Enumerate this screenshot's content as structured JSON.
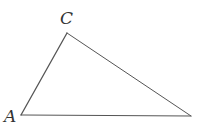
{
  "figure": {
    "type": "triangle",
    "stroke_color": "#555555",
    "vertices": [
      {
        "id": "A",
        "label": "A",
        "x": 21,
        "y": 115,
        "label_x": 4,
        "label_y": 122
      },
      {
        "id": "C",
        "label": "C",
        "x": 67,
        "y": 33,
        "label_x": 60,
        "label_y": 24
      },
      {
        "id": "B",
        "label": "",
        "x": 191,
        "y": 116
      }
    ],
    "sides": [
      {
        "from": "A",
        "to": "C"
      },
      {
        "from": "C",
        "to": "B"
      },
      {
        "from": "A",
        "to": "B"
      }
    ]
  }
}
